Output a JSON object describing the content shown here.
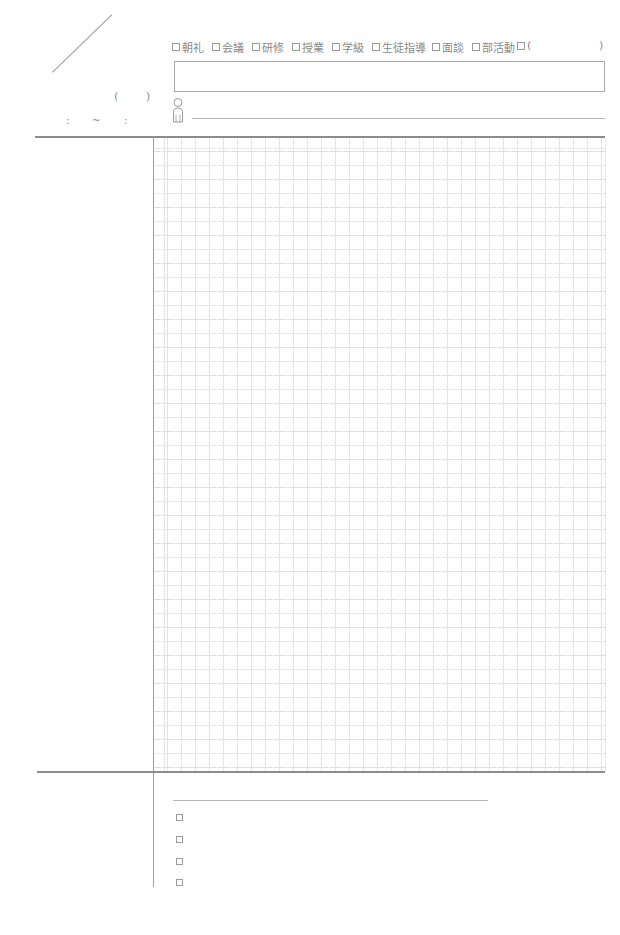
{
  "date_area": {
    "weekday_open_paren": "(",
    "weekday_close_paren": ")",
    "time_start_colon": ":",
    "time_separator": "~",
    "time_end_colon": ":"
  },
  "categories": [
    {
      "label": "朝礼",
      "checked": false
    },
    {
      "label": "会議",
      "checked": false
    },
    {
      "label": "研修",
      "checked": false
    },
    {
      "label": "授業",
      "checked": false
    },
    {
      "label": "学級",
      "checked": false
    },
    {
      "label": "生徒指導",
      "checked": false
    },
    {
      "label": "面談",
      "checked": false
    },
    {
      "label": "部活動",
      "checked": false
    },
    {
      "label": "(",
      "checked": false
    }
  ],
  "category_other_close": ")",
  "title_box": {
    "value": ""
  },
  "attendee": {
    "icon": "person-icon",
    "value": ""
  },
  "notes_grid": {
    "cell_size_px": 14
  },
  "todo": {
    "heading_value": "",
    "items": [
      {
        "text": "",
        "checked": false
      },
      {
        "text": "",
        "checked": false
      },
      {
        "text": "",
        "checked": false
      },
      {
        "text": "",
        "checked": false
      }
    ]
  },
  "colors": {
    "rule": "#8c8c8c",
    "grid": "#e0e0e0",
    "text": "#8a8a8a"
  }
}
